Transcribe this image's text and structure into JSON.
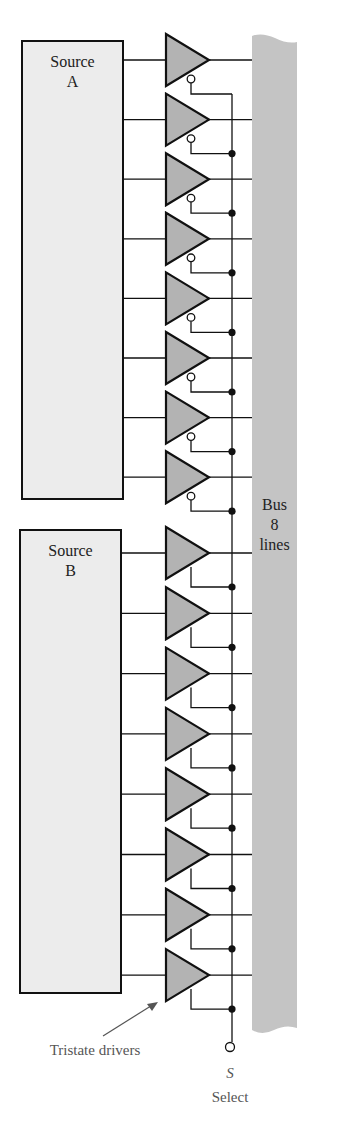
{
  "diagram": {
    "colors": {
      "box_fill": "#ececec",
      "buffer_fill": "#b3b3b3",
      "bus_fill": "#c4c4c4",
      "line": "#111111",
      "label_gray": "#555555"
    },
    "source_a": {
      "line1": "Source",
      "line2": "A"
    },
    "source_b": {
      "line1": "Source",
      "line2": "B"
    },
    "bus": {
      "line1": "Bus",
      "line2": "8",
      "line3": "lines"
    },
    "annotation": {
      "text": "Tristate drivers"
    },
    "select": {
      "symbol": "S",
      "label": "Select"
    },
    "drivers": {
      "source_a_count": 8,
      "source_a_enable": "active-low (bubble)",
      "source_b_count": 8,
      "source_b_enable": "active-high"
    }
  }
}
